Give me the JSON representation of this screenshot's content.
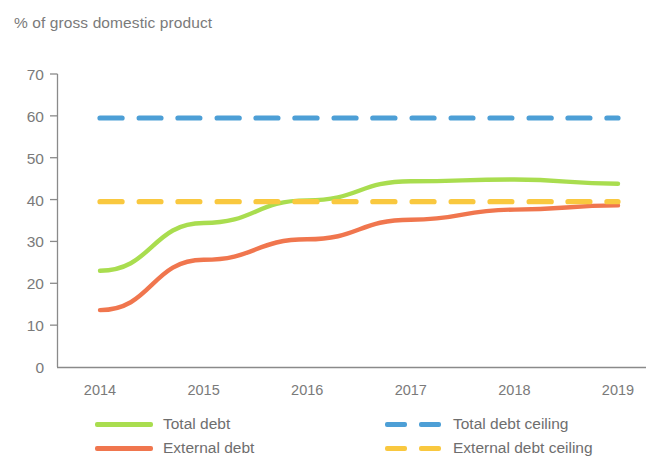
{
  "chart_data": {
    "type": "line",
    "title": "% of gross domestic product",
    "xlabel": "",
    "ylabel": "",
    "x": [
      2014,
      2015,
      2016,
      2017,
      2018,
      2019
    ],
    "xtick_labels": [
      "2014",
      "2015",
      "2016",
      "2017",
      "2018",
      "2019"
    ],
    "ytick_labels": [
      "0",
      "10",
      "20",
      "30",
      "40",
      "50",
      "60",
      "70"
    ],
    "yticks": [
      0,
      10,
      20,
      30,
      40,
      50,
      60,
      70
    ],
    "ylim": [
      0,
      70
    ],
    "xlim": [
      2014,
      2019
    ],
    "grid": false,
    "legend_position": "bottom",
    "series": [
      {
        "name": "Total debt",
        "style": "solid",
        "color": "#a9dd4f",
        "values": [
          23.0,
          34.4,
          39.8,
          44.4,
          44.8,
          43.8
        ]
      },
      {
        "name": "External debt",
        "style": "solid",
        "color": "#f0764e",
        "values": [
          13.6,
          25.6,
          30.5,
          35.2,
          37.6,
          38.6
        ]
      },
      {
        "name": "Total debt ceiling",
        "style": "dashed",
        "color": "#4d9fd6",
        "values": [
          59.5,
          59.5,
          59.5,
          59.5,
          59.5,
          59.5
        ]
      },
      {
        "name": "External debt ceiling",
        "style": "dashed",
        "color": "#f9c83f",
        "values": [
          39.5,
          39.5,
          39.5,
          39.5,
          39.5,
          39.5
        ]
      }
    ]
  },
  "axis_title": "% of gross domestic product",
  "legend": {
    "items": [
      {
        "label": "Total debt",
        "color": "#a9dd4f",
        "style": "solid",
        "column": "left"
      },
      {
        "label": "External debt",
        "color": "#f0764e",
        "style": "solid",
        "column": "left"
      },
      {
        "label": "Total debt ceiling",
        "color": "#4d9fd6",
        "style": "dashed",
        "column": "right"
      },
      {
        "label": "External debt ceiling",
        "color": "#f9c83f",
        "style": "dashed",
        "column": "right"
      }
    ]
  },
  "colors": {
    "total_debt": "#a9dd4f",
    "external_debt": "#f0764e",
    "total_debt_ceiling": "#4d9fd6",
    "external_debt_ceiling": "#f9c83f",
    "axis": "#8a8a8a",
    "text": "#6e6e6e",
    "background": "#ffffff"
  }
}
